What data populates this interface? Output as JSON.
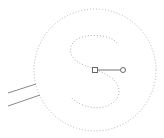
{
  "canvas": {
    "width": 164,
    "height": 138,
    "background": "#ffffff"
  },
  "shapes": {
    "outer_circle": {
      "cx": 95,
      "cy": 70,
      "r": 61,
      "stroke": "#b5b5b5",
      "style": "dotted"
    },
    "s_path": {
      "d": "M117,43 C110,34 86,33 76,40 C66,48 70,60 84,65 C96,70 118,76 119,90 C120,104 102,110 90,107 C80,105 74,101 71,97",
      "stroke": "#b0b0b0",
      "style": "dotted"
    },
    "lines": [
      {
        "x1": 8,
        "y1": 93,
        "x2": 36,
        "y2": 84,
        "stroke": "#8a8a8a"
      },
      {
        "x1": 8,
        "y1": 106,
        "x2": 40,
        "y2": 95,
        "stroke": "#8a8a8a"
      }
    ]
  },
  "editing": {
    "anchor_node": {
      "x": 95,
      "y": 70,
      "size": 5,
      "shape": "square",
      "stroke": "#666666"
    },
    "handle_line": {
      "x1": 98,
      "y1": 70,
      "x2": 120,
      "y2": 70,
      "stroke": "#777777"
    },
    "control_handle": {
      "cx": 123,
      "cy": 70,
      "r": 2.5,
      "shape": "circle",
      "stroke": "#666666"
    }
  }
}
